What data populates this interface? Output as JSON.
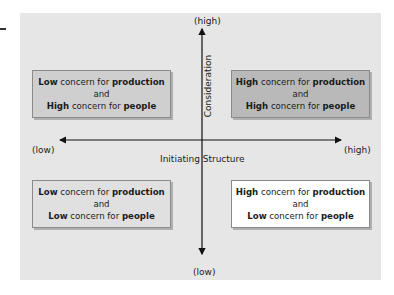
{
  "diagram": {
    "type": "2x2 leadership quadrant",
    "x_axis": {
      "title": "Initiating Structure",
      "low_label": "(low)",
      "high_label": "(high)"
    },
    "y_axis": {
      "title": "Consideration",
      "low_label": "(low)",
      "high_label": "(high)"
    },
    "quadrants": [
      {
        "position": "top-left",
        "line1_bold": "Low",
        "line1_rest": " concern for ",
        "line1_bold2": "production",
        "line2": "and",
        "line3_bold": "High",
        "line3_rest": " concern for ",
        "line3_bold2": "people",
        "fill": "#cfcfcf"
      },
      {
        "position": "top-right",
        "line1_bold": "High",
        "line1_rest": " concern for ",
        "line1_bold2": "production",
        "line2": "and",
        "line3_bold": "High",
        "line3_rest": " concern for ",
        "line3_bold2": "people",
        "fill": "#b9b9b9"
      },
      {
        "position": "bottom-left",
        "line1_bold": "Low",
        "line1_rest": " concern for ",
        "line1_bold2": "production",
        "line2": "and",
        "line3_bold": "Low",
        "line3_rest": " concern for ",
        "line3_bold2": "people",
        "fill": "#e0e0e0"
      },
      {
        "position": "bottom-right",
        "line1_bold": "High",
        "line1_rest": " concern for ",
        "line1_bold2": "production",
        "line2": "and",
        "line3_bold": "Low",
        "line3_rest": " concern for ",
        "line3_bold2": "people",
        "fill": "#ffffff"
      }
    ],
    "colors": {
      "panel_background": "#e6e6e6",
      "axis_line": "#111111"
    }
  }
}
